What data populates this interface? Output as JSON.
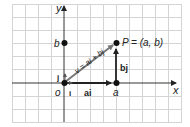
{
  "diagram": {
    "axes": {
      "x_label": "x",
      "y_label": "y",
      "origin_label": "o"
    },
    "points": {
      "origin": "o",
      "a_label": "a",
      "b_label": "b",
      "P_label": "P = (a, b)"
    },
    "vectors": {
      "v_label": "v = ai + bj",
      "ai_label": "ai",
      "bj_label": "bj",
      "i_label": "i",
      "j_label": "j"
    },
    "colors": {
      "grid": "#d0d0d0",
      "axis": "#222222",
      "vector_v": "#777777",
      "vector_components": "#222222",
      "points": "#111111"
    }
  }
}
